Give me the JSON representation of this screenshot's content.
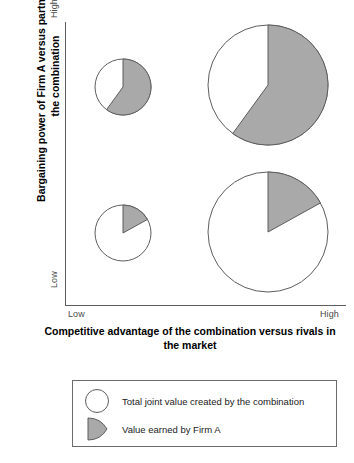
{
  "chart_data": {
    "type": "pie",
    "title": "",
    "xlabel": "Competitive advantage of the combination versus rivals in the market",
    "ylabel": "Bargaining power of Firm A versus partners within the combination",
    "x_ticks": [
      "Low",
      "High"
    ],
    "y_ticks": [
      "Low",
      "High"
    ],
    "grid": false,
    "legend_position": "below-plot",
    "colors": {
      "firm_a_share": "#a9a9a9",
      "remainder": "#ffffff",
      "outline": "#5d5d5d",
      "axis": "#5d5d5d"
    },
    "note": "Four pie markers positioned in a 2x2 matrix. Pie diameter encodes total joint value; grey wedge encodes Firm A's share.",
    "points": [
      {
        "id": "low-advantage-high-power",
        "x_position": "Low-Mid",
        "y_position": "High",
        "cx": 123,
        "cy": 87,
        "radius": 28,
        "total_value_radius_px": 28,
        "firm_a_share_pct": 60,
        "firm_a_share_deg": 216,
        "remainder_pct": 40
      },
      {
        "id": "high-advantage-high-power",
        "x_position": "High",
        "y_position": "High",
        "cx": 268,
        "cy": 85,
        "radius": 60,
        "total_value_radius_px": 60,
        "firm_a_share_pct": 60,
        "firm_a_share_deg": 216,
        "remainder_pct": 40
      },
      {
        "id": "low-advantage-low-power",
        "x_position": "Low-Mid",
        "y_position": "Low",
        "cx": 123,
        "cy": 233,
        "radius": 28,
        "total_value_radius_px": 28,
        "firm_a_share_pct": 17,
        "firm_a_share_deg": 61,
        "remainder_pct": 83
      },
      {
        "id": "high-advantage-low-power",
        "x_position": "High",
        "y_position": "Low",
        "cx": 268,
        "cy": 232,
        "radius": 60,
        "total_value_radius_px": 60,
        "firm_a_share_pct": 17,
        "firm_a_share_deg": 61,
        "remainder_pct": 83
      }
    ],
    "legend": [
      {
        "marker": "open-circle",
        "label": "Total joint value created by the combination"
      },
      {
        "marker": "grey-wedge",
        "label": "Value earned by Firm A"
      }
    ]
  },
  "axes": {
    "y_title": "Bargaining power of Firm A versus partners within the combination",
    "x_title": "Competitive advantage of the combination versus rivals in the market",
    "y_high": "High",
    "y_low": "Low",
    "x_high": "High",
    "x_low": "Low"
  },
  "legend": {
    "total_label": "Total joint value created by the combination",
    "firm_label": "Value earned by Firm A"
  }
}
